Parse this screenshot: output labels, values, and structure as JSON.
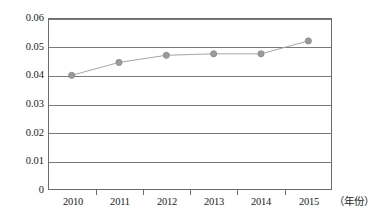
{
  "chart_data": {
    "type": "line",
    "title": "",
    "subtitle": "",
    "xlabel": "（年份）",
    "ylabel": "",
    "categories": [
      "2010",
      "2011",
      "2012",
      "2013",
      "2014",
      "2015"
    ],
    "values": [
      0.04,
      0.0445,
      0.047,
      0.0475,
      0.0475,
      0.052
    ],
    "series": [
      {
        "name": "",
        "values": [
          0.04,
          0.0445,
          0.047,
          0.0475,
          0.0475,
          0.052
        ]
      }
    ],
    "ylim": [
      0,
      0.06
    ],
    "ytick_labels": [
      "0",
      "0.01",
      "0.02",
      "0.03",
      "0.04",
      "0.05",
      "0.06"
    ],
    "ytick_values": [
      0,
      0.01,
      0.02,
      0.03,
      0.04,
      0.05,
      0.06
    ],
    "grid": true,
    "legend": "none",
    "marker": "circle",
    "colors": {
      "line": "#a6a6a6",
      "marker": "#9a9a9a",
      "marker_edge": "#8a8a8a",
      "axis": "#6b6b6b",
      "gridline": "#7a7a7a",
      "text": "#1a1a1a",
      "background": "#ffffff"
    }
  },
  "axes": {
    "y_ticks": [
      {
        "label": "0.06",
        "value": 0.06
      },
      {
        "label": "0.05",
        "value": 0.05
      },
      {
        "label": "0.04",
        "value": 0.04
      },
      {
        "label": "0.03",
        "value": 0.03
      },
      {
        "label": "0.02",
        "value": 0.02
      },
      {
        "label": "0.01",
        "value": 0.01
      },
      {
        "label": "0",
        "value": 0
      }
    ],
    "x_ticks": [
      {
        "label": "2010"
      },
      {
        "label": "2011"
      },
      {
        "label": "2012"
      },
      {
        "label": "2013"
      },
      {
        "label": "2014"
      },
      {
        "label": "2015"
      }
    ],
    "x_axis_title": "（年份）"
  }
}
